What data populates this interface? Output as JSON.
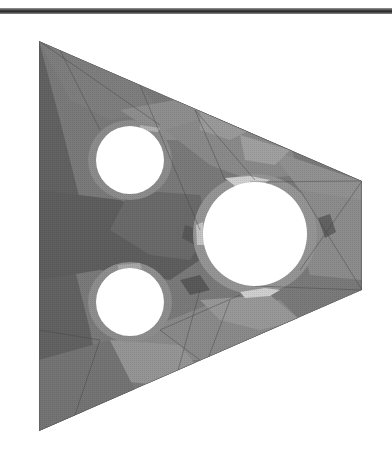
{
  "figure": {
    "colors": {
      "background": "#ffffff",
      "rule": "#2a2a2a",
      "darkest": "#5c5c5c",
      "dark": "#6e6e6e",
      "mid": "#828282",
      "light": "#9a9a9a",
      "lighter": "#b0b0b0",
      "highlight": "#cfcfcf",
      "mesh_line": "#444444"
    },
    "plate_vertices": [
      [
        39,
        41
      ],
      [
        362,
        181
      ],
      [
        362,
        290
      ],
      [
        39,
        431
      ]
    ],
    "holes": [
      {
        "name": "upper-left-hole",
        "cx": 130,
        "cy": 160,
        "r": 34
      },
      {
        "name": "lower-left-hole",
        "cx": 130,
        "cy": 302,
        "r": 34
      },
      {
        "name": "right-hole",
        "cx": 255,
        "cy": 234,
        "r": 52
      }
    ]
  }
}
